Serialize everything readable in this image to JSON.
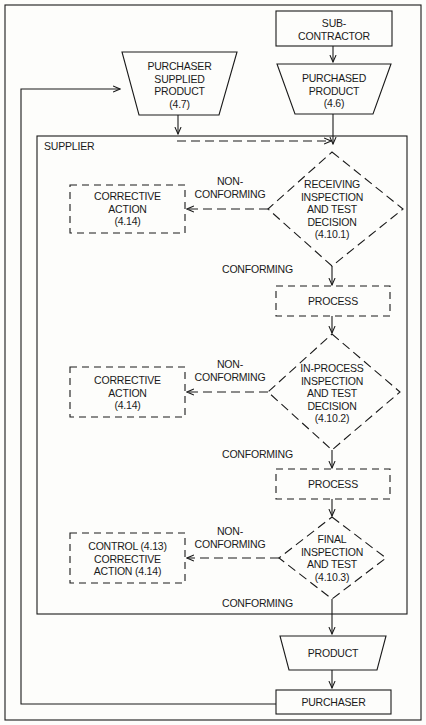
{
  "diagram": {
    "type": "flowchart",
    "colors": {
      "line": "#1a1a1a",
      "background": "#fdfdfb"
    },
    "nodes": {
      "subcontractor": {
        "lines": [
          "SUB-",
          "CONTRACTOR"
        ],
        "shape": "rectangle"
      },
      "purchaser_supplied_product": {
        "lines": [
          "PURCHASER",
          "SUPPLIED",
          "PRODUCT",
          "(4.7)"
        ],
        "shape": "trapezoid"
      },
      "purchased_product": {
        "lines": [
          "PURCHASED",
          "PRODUCT",
          "(4.6)"
        ],
        "shape": "trapezoid"
      },
      "supplier": {
        "label": "SUPPLIER",
        "shape": "container"
      },
      "receiving_decision": {
        "lines": [
          "RECEIVING",
          "INSPECTION",
          "AND TEST",
          "DECISION",
          "(4.10.1)"
        ],
        "shape": "dashed-diamond"
      },
      "corrective_action_1": {
        "lines": [
          "CORRECTIVE",
          "ACTION",
          "(4.14)"
        ],
        "shape": "dashed-rectangle"
      },
      "process_1": {
        "label": "PROCESS",
        "shape": "dashed-rectangle"
      },
      "inprocess_decision": {
        "lines": [
          "IN-PROCESS",
          "INSPECTION",
          "AND TEST",
          "DECISION",
          "(4.10.2)"
        ],
        "shape": "dashed-diamond"
      },
      "corrective_action_2": {
        "lines": [
          "CORRECTIVE",
          "ACTION",
          "(4.14)"
        ],
        "shape": "dashed-rectangle"
      },
      "process_2": {
        "label": "PROCESS",
        "shape": "dashed-rectangle"
      },
      "final_decision": {
        "lines": [
          "FINAL",
          "INSPECTION",
          "AND TEST",
          "(4.10.3)"
        ],
        "shape": "dashed-diamond"
      },
      "control_corrective": {
        "lines": [
          "CONTROL (4.13)",
          "CORRECTIVE",
          "ACTION (4.14)"
        ],
        "shape": "dashed-rectangle"
      },
      "product": {
        "label": "PRODUCT",
        "shape": "trapezoid"
      },
      "purchaser": {
        "label": "PURCHASER",
        "shape": "rectangle"
      }
    },
    "edge_labels": {
      "nonconforming_1": [
        "NON-",
        "CONFORMING"
      ],
      "conforming_1": "CONFORMING",
      "nonconforming_2": [
        "NON-",
        "CONFORMING"
      ],
      "conforming_2": "CONFORMING",
      "nonconforming_3": [
        "NON-",
        "CONFORMING"
      ],
      "conforming_3": "CONFORMING"
    }
  }
}
